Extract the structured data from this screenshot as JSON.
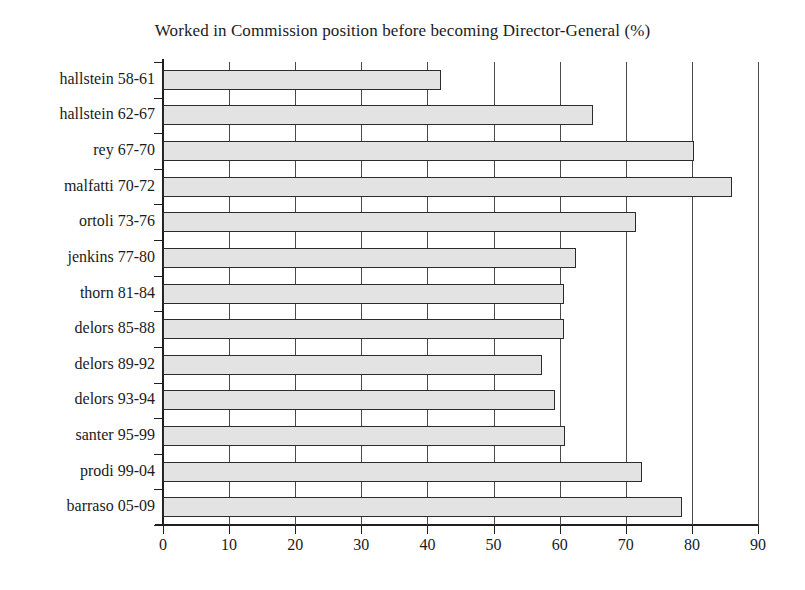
{
  "chart_data": {
    "type": "bar",
    "orientation": "horizontal",
    "title": "Worked in Commission position before becoming Director-General (%)",
    "xlabel": "",
    "ylabel": "",
    "xlim": [
      0,
      90
    ],
    "xticks": [
      0,
      10,
      20,
      30,
      40,
      50,
      60,
      70,
      80,
      90
    ],
    "xtick_labels": [
      "0",
      "10",
      "20",
      "30",
      "40",
      "50",
      "60",
      "70",
      "80",
      "90"
    ],
    "grid": "vertical",
    "legend": "none",
    "categories": [
      "hallstein 58-61",
      "hallstein 62-67",
      "rey 67-70",
      "malfatti 70-72",
      "ortoli 73-76",
      "jenkins 77-80",
      "thorn 81-84",
      "delors 85-88",
      "delors 89-92",
      "delors 93-94",
      "santer 95-99",
      "prodi 99-04",
      "barraso 05-09"
    ],
    "values": [
      42,
      65,
      80.3,
      86,
      71.5,
      62.5,
      60.7,
      60.7,
      57.3,
      59.3,
      60.8,
      72.5,
      78.5
    ],
    "bar_fill_color": "#e3e3e3",
    "bar_border_color": "#2c2c2c",
    "axis_color": "#1f1f1f",
    "gridline_color": "#4a4a4a",
    "background_color": "#ffffff"
  }
}
